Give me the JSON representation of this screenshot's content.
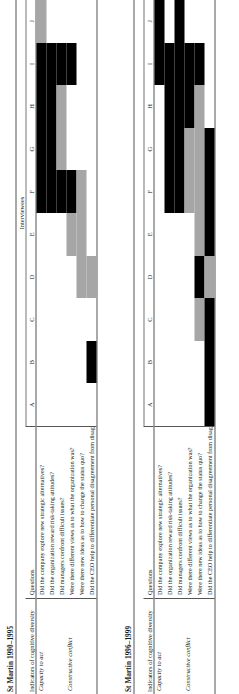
{
  "figure": {
    "interviewees_header": "Interviewees",
    "columns": [
      "A",
      "B",
      "C",
      "D",
      "E",
      "F",
      "G",
      "H",
      "I",
      "J"
    ],
    "header_indicators": "Indicators of cognitive diversity",
    "header_questions": "Questions",
    "groups": [
      "Capacity to act",
      "Constructive conflict"
    ],
    "questions": [
      "Did the company explore new strategic alternatives?",
      "Did the organization reward risk-taking attitudes?",
      "Did managers confront difficult issues?",
      "Were there different views as to what the organization was?",
      "Were there new ideas as to how to change the status quo?",
      "Did the CEO help to differentiate personal disagreement from disagreement on issues?"
    ],
    "colors": {
      "black": "#000000",
      "grey": "#a6a6a6",
      "rule": "#555555"
    }
  },
  "chart_data": {
    "type": "heatmap",
    "xlabel": "Interviewees",
    "ylabel": "Questions",
    "categories": [
      "A",
      "B",
      "C",
      "D",
      "E",
      "F",
      "G",
      "H",
      "I",
      "J"
    ],
    "legend": [
      {
        "name": "strong indication",
        "color": "#000000"
      },
      {
        "name": "partial indication",
        "color": "#a6a6a6"
      },
      {
        "name": "no indication",
        "color": "#ffffff"
      }
    ],
    "panels": [
      {
        "title": "St Martin 1990–1995",
        "rows": [
          {
            "group": "Capacity to act",
            "question": "Did the company explore new strategic alternatives?",
            "values": [
              "none",
              "none",
              "none",
              "none",
              "none",
              "black",
              "black",
              "black",
              "black",
              "grey"
            ]
          },
          {
            "group": "Capacity to act",
            "question": "Did the organization reward risk-taking attitudes?",
            "values": [
              "none",
              "none",
              "none",
              "none",
              "none",
              "black",
              "black",
              "black",
              "black",
              "none"
            ]
          },
          {
            "group": "Capacity to act",
            "question": "Did managers confront difficult issues?",
            "values": [
              "none",
              "none",
              "none",
              "none",
              "none",
              "black",
              "grey",
              "grey",
              "black",
              "none"
            ]
          },
          {
            "group": "Constructive conflict",
            "question": "Were there different views as to what the organization was?",
            "values": [
              "none",
              "none",
              "none",
              "none",
              "grey",
              "black",
              "none",
              "none",
              "black",
              "none"
            ]
          },
          {
            "group": "Constructive conflict",
            "question": "Were there new ideas as to how to change the status quo?",
            "values": [
              "none",
              "none",
              "none",
              "grey",
              "grey",
              "grey",
              "none",
              "none",
              "none",
              "none"
            ]
          },
          {
            "group": "Constructive conflict",
            "question": "Did the CEO help to differentiate personal disagreement from disagreement on issues?",
            "values": [
              "none",
              "black",
              "none",
              "grey",
              "none",
              "none",
              "none",
              "none",
              "none",
              "none"
            ]
          }
        ]
      },
      {
        "title": "St Martin 1996–1999",
        "rows": [
          {
            "group": "Capacity to act",
            "question": "Did the company explore new strategic alternatives?",
            "values": [
              "none",
              "none",
              "none",
              "none",
              "none",
              "none",
              "none",
              "none",
              "black",
              "black"
            ]
          },
          {
            "group": "Capacity to act",
            "question": "Did the organization reward risk-taking attitudes?",
            "values": [
              "none",
              "none",
              "none",
              "none",
              "none",
              "black",
              "black",
              "black",
              "black",
              "none"
            ]
          },
          {
            "group": "Capacity to act",
            "question": "Did managers confront difficult issues?",
            "values": [
              "none",
              "none",
              "none",
              "none",
              "none",
              "black",
              "black",
              "black",
              "black",
              "black"
            ]
          },
          {
            "group": "Constructive conflict",
            "question": "Were there different views as to what the organization was?",
            "values": [
              "none",
              "none",
              "none",
              "none",
              "none",
              "grey",
              "grey",
              "black",
              "black",
              "none"
            ]
          },
          {
            "group": "Constructive conflict",
            "question": "Were there new ideas as to how to change the status quo?",
            "values": [
              "none",
              "none",
              "grey",
              "black",
              "grey",
              "grey",
              "grey",
              "grey",
              "black",
              "none"
            ]
          },
          {
            "group": "Constructive conflict",
            "question": "Did the CEO help to differentiate personal disagreement from disagreement on issues?",
            "values": [
              "black",
              "black",
              "black",
              "grey",
              "black",
              "black",
              "black",
              "none",
              "none",
              "none"
            ]
          }
        ]
      }
    ]
  }
}
